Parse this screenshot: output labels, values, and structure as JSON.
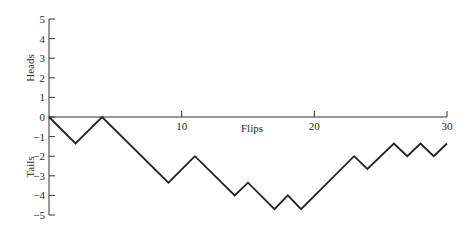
{
  "chart_data": {
    "type": "line",
    "title": "",
    "xlabel": "Flips",
    "ylabel_top": "Heads",
    "ylabel_bottom": "Tails",
    "xlim": [
      0,
      30
    ],
    "ylim": [
      -5,
      5
    ],
    "grid": false,
    "legend": null,
    "x_ticks": [
      10,
      20,
      30
    ],
    "x_tick_labels": [
      "10",
      "20",
      "30"
    ],
    "y_ticks": [
      5,
      4,
      3,
      2,
      1,
      0,
      -1,
      -2,
      -3,
      -4,
      -5
    ],
    "y_tick_labels": [
      "5",
      "4",
      "3",
      "2",
      "1",
      "0",
      "−1",
      "−2",
      "−3",
      "−4",
      "−5"
    ],
    "series": [
      {
        "name": "Random walk",
        "color": "#222222",
        "x": [
          0,
          2,
          4,
          9,
          11,
          14,
          15,
          17,
          18,
          19,
          23,
          24,
          26,
          27,
          28,
          29,
          30
        ],
        "values": [
          0,
          -1.35,
          0,
          -3.35,
          -2.0,
          -4.0,
          -3.35,
          -4.7,
          -4.0,
          -4.7,
          -2.0,
          -2.65,
          -1.35,
          -2.0,
          -1.35,
          -2.0,
          -1.35
        ]
      }
    ]
  },
  "style": {
    "axis_color": "#333333",
    "line_color": "#222222",
    "background": "#ffffff"
  }
}
